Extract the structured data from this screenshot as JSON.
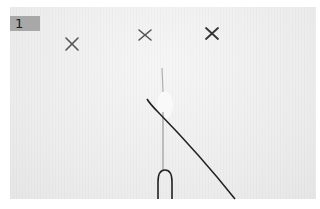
{
  "figure": {
    "step_label": "1",
    "colors": {
      "background": "#ffffff",
      "fabric": "#ececec",
      "badge": "#a8a8a8",
      "thread": "#2a2a2a"
    },
    "marks": [
      {
        "icon": "x-mark-icon",
        "x": 72,
        "y": 44
      },
      {
        "icon": "x-mark-icon",
        "x": 145,
        "y": 35
      },
      {
        "icon": "x-mark-icon",
        "x": 212,
        "y": 34
      }
    ]
  }
}
